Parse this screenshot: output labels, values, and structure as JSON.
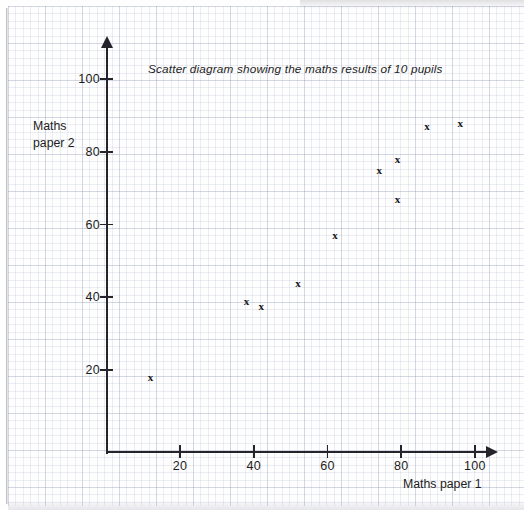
{
  "chart_data": {
    "type": "scatter",
    "title": "Scatter diagram showing the maths results of 10 pupils",
    "xlabel": "Maths paper 1",
    "ylabel_line1": "Maths",
    "ylabel_line2": "paper 2",
    "xlim": [
      0,
      105
    ],
    "ylim": [
      0,
      108
    ],
    "xticks": [
      20,
      40,
      60,
      80,
      100
    ],
    "yticks": [
      20,
      40,
      60,
      80,
      100
    ],
    "grid": "graph-paper",
    "legend": "none",
    "marker": "x",
    "marker_color": "#17171c",
    "points": [
      {
        "x": 12,
        "y": 18
      },
      {
        "x": 38,
        "y": 39
      },
      {
        "x": 42,
        "y": 37.5
      },
      {
        "x": 52,
        "y": 44
      },
      {
        "x": 62,
        "y": 57
      },
      {
        "x": 74,
        "y": 75
      },
      {
        "x": 79,
        "y": 78
      },
      {
        "x": 79,
        "y": 67
      },
      {
        "x": 87,
        "y": 87
      },
      {
        "x": 96,
        "y": 88
      }
    ]
  },
  "axes": {
    "y_tick_labels": [
      "20",
      "40",
      "60",
      "80",
      "100"
    ],
    "x_tick_labels": [
      "20",
      "40",
      "60",
      "80",
      "100"
    ]
  },
  "colors": {
    "ink": "#1d1d22",
    "axis": "#24242a",
    "grid": "#96a0b9",
    "paper": "#fefeff"
  }
}
